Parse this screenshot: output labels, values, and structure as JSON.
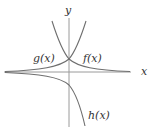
{
  "diagram": {
    "title": "",
    "axes": {
      "x_label": "x",
      "y_label": "y"
    },
    "curves": [
      {
        "id": "f",
        "label": "f(x)",
        "description": "decreasing exponential, approaches x-axis to the right"
      },
      {
        "id": "g",
        "label": "g(x)",
        "description": "increasing exponential, approaches x-axis to the left"
      },
      {
        "id": "h",
        "label": "h(x)",
        "description": "reflected exponential below x-axis, decreasing to the right"
      }
    ],
    "colors": {
      "axis": "#9a9a9a",
      "curve": "#6e6e6e",
      "text": "#333333"
    }
  }
}
